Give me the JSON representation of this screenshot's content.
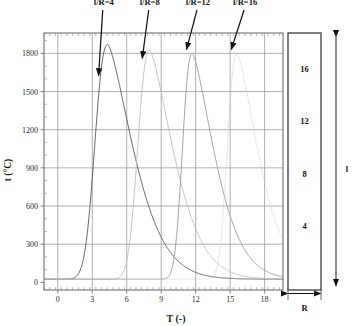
{
  "chart_data": {
    "type": "line",
    "title": "",
    "xlabel": "T (-)",
    "ylabel": "t (°C)",
    "xlim": [
      -1.2,
      19.6
    ],
    "ylim": [
      -60,
      1960
    ],
    "xticks": [
      0,
      3,
      6,
      9,
      12,
      15,
      18
    ],
    "xtick_labels": [
      "0",
      "3",
      "6",
      "9",
      "12",
      "15",
      "18"
    ],
    "yticks": [
      0,
      300,
      600,
      900,
      1200,
      1500,
      1800
    ],
    "ytick_labels": [
      "0",
      "300",
      "600",
      "900",
      "1200",
      "1500",
      "1800"
    ],
    "grid": true,
    "minor_ticks": true,
    "legend_position": "annotations-above-plot",
    "series": [
      {
        "name": "l/R=4",
        "label": "l/R=4",
        "color": "#555555",
        "dash": "none",
        "peak_x": 4.35,
        "peak_y": 1870,
        "rise_width": 1.45,
        "decay_width": 3.2,
        "baseline": 25
      },
      {
        "name": "l/R=8",
        "label": "l/R=8",
        "color": "#bdbdbd",
        "dash": "none",
        "peak_x": 8.0,
        "peak_y": 1825,
        "rise_width": 1.35,
        "decay_width": 3.0,
        "baseline": 25
      },
      {
        "name": "l/R=12",
        "label": "l/R=12",
        "color": "#9a9a9a",
        "dash": "none",
        "peak_x": 11.7,
        "peak_y": 1800,
        "rise_width": 1.1,
        "decay_width": 2.8,
        "baseline": 25
      },
      {
        "name": "l/R=16",
        "label": "l/R=16",
        "color": "#c8c8c8",
        "dash": "dotted",
        "peak_x": 15.6,
        "peak_y": 1795,
        "rise_width": 1.1,
        "decay_width": 2.7,
        "baseline": 25
      }
    ],
    "annotations": [
      {
        "text": "l/R=4",
        "label_x": 4.0,
        "label_y": 2180,
        "tip_x": 3.55,
        "tip_y": 1625
      },
      {
        "text": "l/R=8",
        "label_x": 8.0,
        "label_y": 2180,
        "tip_x": 7.35,
        "tip_y": 1760
      },
      {
        "text": "l/R=12",
        "label_x": 12.2,
        "label_y": 2180,
        "tip_x": 11.2,
        "tip_y": 1830
      },
      {
        "text": "l/R=16",
        "label_x": 16.3,
        "label_y": 2180,
        "tip_x": 15.1,
        "tip_y": 1830
      }
    ]
  },
  "diagram": {
    "name": "rod-schematic",
    "segment_labels": [
      "16",
      "12",
      "8",
      "4"
    ],
    "length_label": "l",
    "radius_label": "R"
  }
}
